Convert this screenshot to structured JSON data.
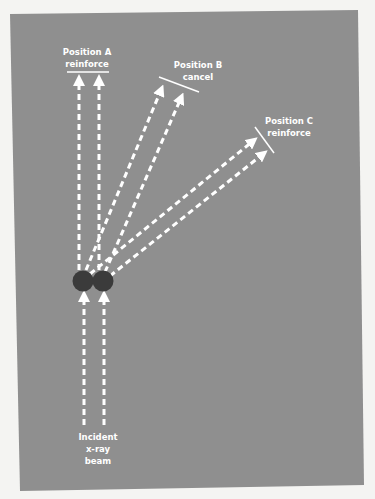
{
  "diagram": {
    "colors": {
      "page_bg": "#f4f4f2",
      "panel_bg": "#8f8f8f",
      "beam": "#ffffff",
      "atom": "#3b3b3b",
      "text": "#ffffff"
    },
    "labels": {
      "position_a": {
        "line1": "Position A",
        "line2": "reinforce"
      },
      "position_b": {
        "line1": "Position B",
        "line2": "cancel"
      },
      "position_c": {
        "line1": "Position C",
        "line2": "reinforce"
      },
      "incident": {
        "line1": "Incident",
        "line2": "x-ray",
        "line3": "beam"
      }
    },
    "nodes": [
      {
        "id": "atom-1",
        "shape": "circle",
        "fill": "dark gray"
      },
      {
        "id": "atom-2",
        "shape": "circle",
        "fill": "dark gray"
      }
    ],
    "edges": [
      {
        "from": "source",
        "to": "atom-1",
        "style": "dashed arrow",
        "label": "Incident x-ray beam"
      },
      {
        "from": "source",
        "to": "atom-2",
        "style": "dashed arrow",
        "label": "Incident x-ray beam"
      },
      {
        "from": "atom-1",
        "to": "position-a",
        "style": "dashed arrow"
      },
      {
        "from": "atom-2",
        "to": "position-a",
        "style": "dashed arrow"
      },
      {
        "from": "atom-1",
        "to": "position-b",
        "style": "dashed arrow"
      },
      {
        "from": "atom-2",
        "to": "position-b",
        "style": "dashed arrow"
      },
      {
        "from": "atom-1",
        "to": "position-c",
        "style": "dashed arrow"
      },
      {
        "from": "atom-2",
        "to": "position-c",
        "style": "dashed arrow"
      }
    ]
  }
}
